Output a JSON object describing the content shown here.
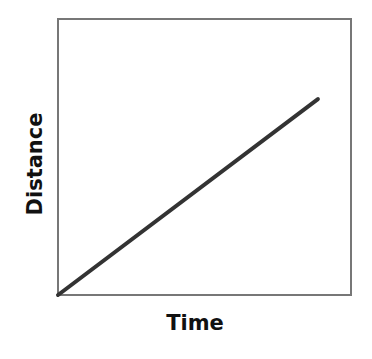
{
  "chart_data": {
    "type": "line",
    "title": "",
    "xlabel": "Time",
    "ylabel": "Distance",
    "x": [
      0,
      1
    ],
    "series": [
      {
        "name": "distance-vs-time",
        "values": [
          0,
          0.71
        ]
      }
    ],
    "xlim": [
      0,
      1
    ],
    "ylim": [
      0,
      1
    ],
    "grid": false,
    "legend": null,
    "ticks": {
      "x": [],
      "y": []
    }
  },
  "colors": {
    "line": "#333333",
    "frame": "#777777",
    "text": "#111111",
    "background": "#ffffff"
  }
}
